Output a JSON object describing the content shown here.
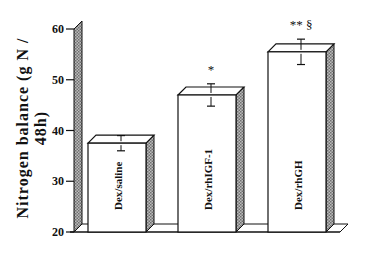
{
  "chart_data": {
    "type": "bar",
    "style": "3d",
    "title": "",
    "xlabel": "",
    "ylabel": "Nitrogen balance (g N / 48h)",
    "ylim": [
      20,
      60
    ],
    "yticks": [
      20,
      30,
      40,
      50,
      60
    ],
    "grid": false,
    "categories": [
      "Dex/saline",
      "Dex/rhIGF-1",
      "Dex/rhGH"
    ],
    "values": [
      37.5,
      47,
      55.5
    ],
    "error": [
      1.5,
      2.2,
      2.5
    ],
    "annotations": [
      "",
      "*",
      "** §"
    ],
    "legend": null
  },
  "labels": {
    "ylabel": "Nitrogen balance (g N / 48h)",
    "ticks": [
      "20",
      "30",
      "40",
      "50",
      "60"
    ],
    "bars": [
      "Dex/saline",
      "Dex/rhIGF-1",
      "Dex/rhGH"
    ],
    "sig": [
      "",
      "*",
      "** §"
    ]
  },
  "colors": {
    "ink": "#111111",
    "bar_face": "#ffffff",
    "hatch": "#888888"
  }
}
